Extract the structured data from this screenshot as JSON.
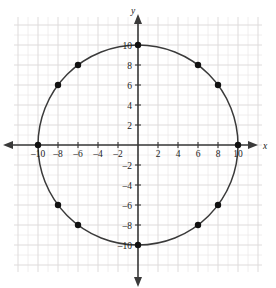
{
  "figure": {
    "kind": "coordinate-plane-graph",
    "background_color": "#ffffff",
    "axis_color": "#3a3a3a",
    "curve_color": "#3a3a3a",
    "point_color": "#111111",
    "minor_grid_color": "#eceaea",
    "major_grid_color": "#dedbdb",
    "x_axis_label": "x",
    "y_axis_label": "y"
  },
  "chart_data": {
    "type": "scatter",
    "title": "",
    "subtitle": "",
    "xlabel": "x",
    "ylabel": "y",
    "xlim": [
      -12.4,
      12.4
    ],
    "ylim": [
      -12.8,
      12.8
    ],
    "grid": true,
    "grid_minor_step": 1,
    "grid_major_step": 2,
    "legend": "none",
    "xticks": [
      -10,
      -8,
      -6,
      -4,
      -2,
      2,
      4,
      6,
      8,
      10
    ],
    "xtick_labels": [
      "–10",
      "–8",
      "–6",
      "–4",
      "–2",
      "2",
      "4",
      "6",
      "8",
      "10"
    ],
    "yticks": [
      10,
      8,
      6,
      4,
      2,
      -2,
      -4,
      -6,
      -8,
      -10
    ],
    "ytick_labels": [
      "10",
      "8",
      "6",
      "4",
      "2",
      "–2",
      "–4",
      "–6",
      "–8",
      "–10"
    ],
    "series": [
      {
        "name": "circle",
        "kind": "curve",
        "equation": "x^2 + y^2 = 100",
        "center": [
          0,
          0
        ],
        "radius": 10
      },
      {
        "name": "lattice points on circle",
        "kind": "points",
        "points": [
          {
            "x": 0,
            "y": 10
          },
          {
            "x": 6,
            "y": 8
          },
          {
            "x": 8,
            "y": 6
          },
          {
            "x": 10,
            "y": 0
          },
          {
            "x": 8,
            "y": -6
          },
          {
            "x": 6,
            "y": -8
          },
          {
            "x": 0,
            "y": -10
          },
          {
            "x": -6,
            "y": -8
          },
          {
            "x": -8,
            "y": -6
          },
          {
            "x": -10,
            "y": 0
          },
          {
            "x": -8,
            "y": 6
          },
          {
            "x": -6,
            "y": 8
          }
        ]
      }
    ]
  }
}
